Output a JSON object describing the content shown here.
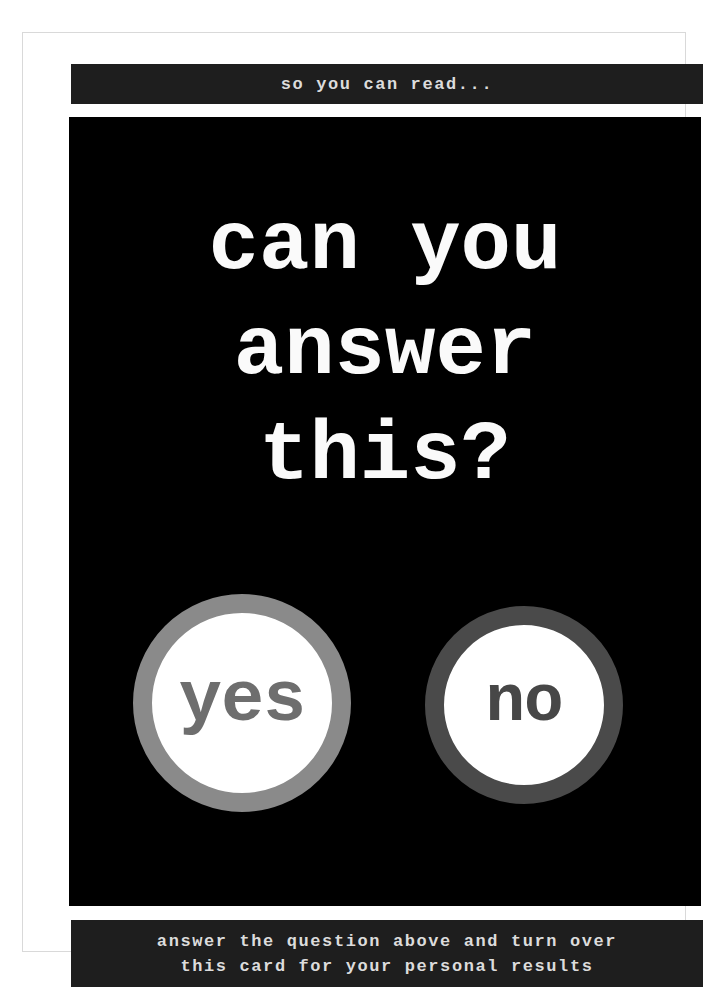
{
  "card": {
    "top_banner": "so you can read...",
    "question_lines": [
      "can you",
      "answer",
      "this?"
    ],
    "answers": [
      {
        "label": "yes",
        "ring_color": "#8a8a8a",
        "text_color": "#6e6e6e"
      },
      {
        "label": "no",
        "ring_color": "#4a4a4a",
        "text_color": "#474747"
      }
    ],
    "bottom_banner_lines": [
      "answer the question above and turn over",
      "this card for your personal results"
    ],
    "colors": {
      "card_background": "#000000",
      "banner_background": "#1e1e1e",
      "banner_text": "#dcdcdc",
      "question_text": "#fafafa",
      "page_background": "#ffffff",
      "frame_border": "#d9d9d9"
    }
  }
}
